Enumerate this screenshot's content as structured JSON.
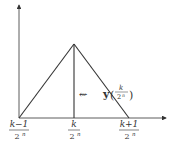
{
  "diagram": {
    "type": "hat-function",
    "x_labels": [
      {
        "num": "k−1",
        "den": "2",
        "exp": "n"
      },
      {
        "num": "k",
        "den": "2",
        "exp": "n"
      },
      {
        "num": "k+1",
        "den": "2",
        "exp": "n"
      }
    ],
    "annotation": {
      "arrow": "⇜",
      "symbol": "y",
      "arg_num": "k",
      "arg_den": "2",
      "arg_exp": "n",
      "open_paren": "(",
      "close_paren": ")"
    },
    "colors": {
      "line": "#333333",
      "axis": "#333333"
    }
  }
}
